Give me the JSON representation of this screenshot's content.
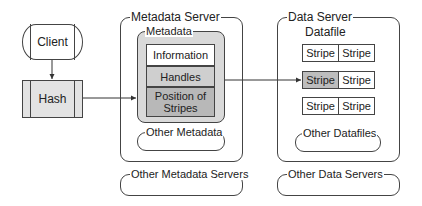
{
  "client": {
    "label": "Client"
  },
  "hash": {
    "label": "Hash"
  },
  "metadata_server": {
    "title": "Metadata Server",
    "metadata": {
      "title": "Metadata",
      "fields": [
        "Information",
        "Handles",
        "Position of Stripes"
      ]
    },
    "other_metadata": "Other Metadata"
  },
  "other_metadata_servers": "Other Metadata Servers",
  "data_server": {
    "title": "Data Server",
    "datafile": {
      "title": "Datafile",
      "rows": [
        [
          "Stripe",
          "Stripe"
        ],
        [
          "Stripe",
          "Stripe"
        ],
        [
          "Stripe",
          "Stripe"
        ]
      ],
      "highlighted_cell": "row 2, column 1"
    },
    "other_datafiles": "Other Datafiles"
  },
  "other_data_servers": "Other Data Servers",
  "colors": {
    "stroke": "#444444",
    "metadata_fill": "#d9d9d9",
    "info_fill": "#ffffff",
    "handles_fill": "#cfcfcf",
    "position_fill": "#b8b8b8",
    "stripe_highlight": "#bdbdbd",
    "hash_fill": "#e3e3e3"
  }
}
